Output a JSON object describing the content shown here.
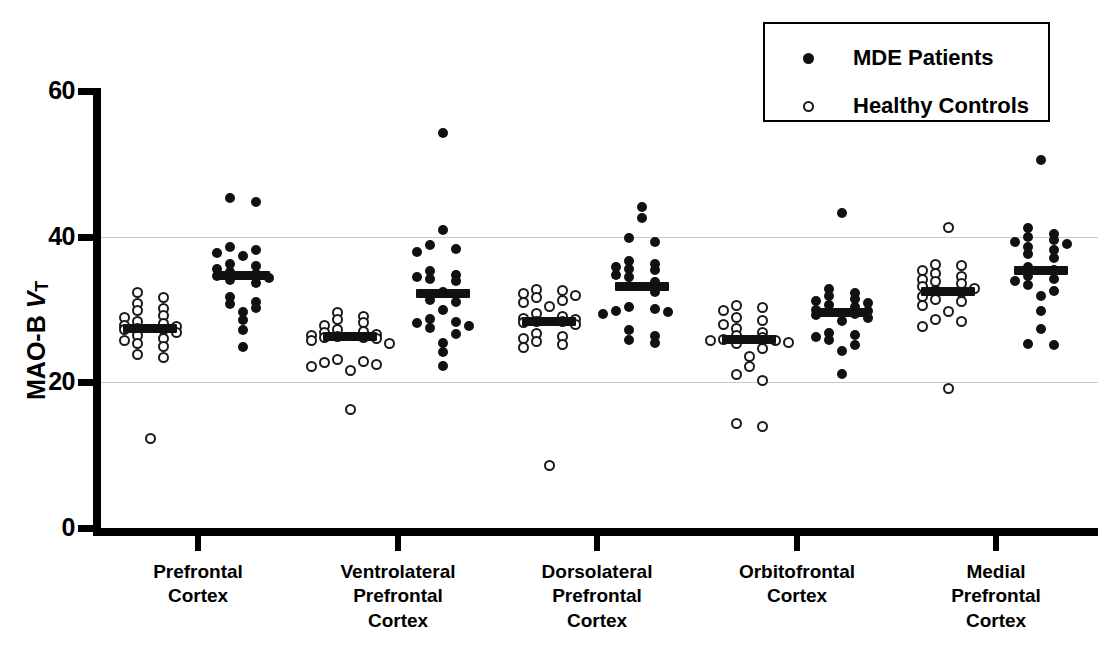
{
  "chart_data": {
    "type": "scatter",
    "title": "",
    "xlabel": "",
    "ylabel": "MAO-B VT",
    "ylabel_prefix": "MAO-B ",
    "ylabel_italic": "V",
    "ylabel_sub": "T",
    "ylim": [
      0,
      60
    ],
    "yticks": [
      0,
      20,
      40,
      60
    ],
    "ytick_labels": [
      "0",
      "20",
      "40",
      "60"
    ],
    "gridlines": [
      20,
      40
    ],
    "grid": true,
    "legend_position": "top-right",
    "categories": [
      "Prefrontal\nCortex",
      "Ventrolateral\nPrefrontal\nCortex",
      "Dorsolateral\nPrefrontal\nCortex",
      "Orbitofrontal\nCortex",
      "Medial\nPrefrontal\nCortex"
    ],
    "series": [
      {
        "name": "Healthy Controls",
        "marker": "open-circle",
        "color": "#ffffff",
        "edge_color": "#1a1a1a",
        "groups": [
          {
            "category": "Prefrontal Cortex",
            "mean": 27.4,
            "values": [
              32.3,
              31.6,
              30.8,
              30.1,
              29.8,
              29.2,
              28.9,
              28.4,
              28.1,
              27.8,
              27.6,
              27.4,
              27.3,
              27.2,
              26.9,
              26.4,
              26.0,
              25.7,
              25.3,
              24.9,
              23.8,
              23.4,
              12.3
            ]
          },
          {
            "category": "Ventrolateral Prefrontal Cortex",
            "mean": 26.3,
            "values": [
              29.6,
              29.0,
              28.6,
              28.2,
              27.8,
              27.3,
              27.0,
              26.8,
              26.6,
              26.4,
              26.3,
              26.2,
              26.1,
              26.0,
              25.8,
              25.4,
              23.1,
              22.9,
              22.7,
              22.4,
              22.2,
              21.6,
              16.3
            ]
          },
          {
            "category": "Dorsolateral Prefrontal Cortex",
            "mean": 28.4,
            "values": [
              32.7,
              32.6,
              32.2,
              31.9,
              31.6,
              31.2,
              30.9,
              30.4,
              29.4,
              29.0,
              28.8,
              28.6,
              28.4,
              28.3,
              28.2,
              27.9,
              26.7,
              26.3,
              26.0,
              25.6,
              25.2,
              24.8,
              8.6
            ]
          },
          {
            "category": "Orbitofrontal Cortex",
            "mean": 25.9,
            "values": [
              30.6,
              30.3,
              29.8,
              28.9,
              28.5,
              28.0,
              27.4,
              26.8,
              26.4,
              26.1,
              25.9,
              25.8,
              25.7,
              25.5,
              25.3,
              24.6,
              23.6,
              22.2,
              21.1,
              20.3,
              14.4,
              13.9
            ]
          },
          {
            "category": "Medial Prefrontal Cortex",
            "mean": 32.6,
            "values": [
              41.3,
              36.2,
              36.0,
              35.4,
              34.9,
              34.5,
              34.1,
              33.8,
              33.6,
              33.2,
              32.9,
              32.6,
              32.4,
              31.8,
              31.4,
              31.1,
              30.6,
              29.7,
              28.6,
              28.4,
              27.7,
              19.2
            ]
          }
        ]
      },
      {
        "name": "MDE Patients",
        "marker": "filled-circle",
        "color": "#111111",
        "edge_color": "#111111",
        "groups": [
          {
            "category": "Prefrontal Cortex",
            "mean": 34.8,
            "values": [
              45.3,
              44.8,
              38.6,
              38.2,
              37.8,
              37.4,
              36.3,
              36.0,
              35.5,
              35.2,
              34.9,
              34.6,
              34.3,
              34.0,
              33.6,
              31.7,
              31.0,
              30.7,
              30.2,
              29.6,
              28.6,
              27.2,
              24.9
            ]
          },
          {
            "category": "Ventrolateral Prefrontal Cortex",
            "mean": 32.3,
            "values": [
              54.3,
              40.9,
              38.8,
              38.3,
              37.9,
              35.3,
              34.8,
              34.4,
              34.2,
              33.9,
              32.4,
              31.3,
              31.0,
              29.9,
              28.7,
              28.3,
              28.1,
              27.8,
              27.4,
              26.7,
              25.4,
              24.1,
              22.3
            ]
          },
          {
            "category": "Dorsolateral Prefrontal Cortex",
            "mean": 33.2,
            "values": [
              44.1,
              42.6,
              39.8,
              39.2,
              36.6,
              36.2,
              35.8,
              35.5,
              35.4,
              34.8,
              34.5,
              33.8,
              33.2,
              32.4,
              30.3,
              30.1,
              29.8,
              29.6,
              29.4,
              27.2,
              26.3,
              25.8,
              25.4
            ]
          },
          {
            "category": "Orbitofrontal Cortex",
            "mean": 29.6,
            "values": [
              43.3,
              32.8,
              32.2,
              31.8,
              31.5,
              31.2,
              30.9,
              30.6,
              30.3,
              30.0,
              29.8,
              29.6,
              29.4,
              29.2,
              28.8,
              28.4,
              26.8,
              26.5,
              26.2,
              25.8,
              25.1,
              24.3,
              21.2
            ]
          },
          {
            "category": "Medial Prefrontal Cortex",
            "mean": 35.4,
            "values": [
              50.5,
              41.2,
              40.4,
              39.9,
              39.5,
              39.3,
              39.0,
              38.6,
              38.2,
              37.6,
              37.1,
              35.8,
              35.4,
              34.6,
              34.2,
              33.9,
              33.3,
              32.6,
              31.9,
              29.8,
              27.3,
              25.3,
              25.1
            ]
          }
        ]
      }
    ]
  },
  "legend": {
    "entries": [
      {
        "label": "MDE Patients",
        "marker": "filled-circle"
      },
      {
        "label": "Healthy Controls",
        "marker": "open-circle"
      }
    ]
  }
}
